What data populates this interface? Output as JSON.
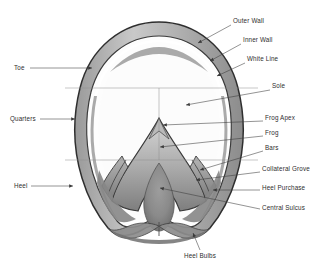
{
  "figure": {
    "style": "pencil sketch line drawing with labelled leader lines",
    "background_color": "#ffffff",
    "ink_color": "#2e2e2e",
    "leader_color": "#3a3a3a",
    "reference_line_color": "#8e8e8e"
  },
  "labels": {
    "left": [
      {
        "id": "toe",
        "text": "Toe",
        "text_x": 14,
        "text_y": 70,
        "line_x1": 30,
        "line_y1": 68,
        "line_x2": 92,
        "line_y2": 68
      },
      {
        "id": "quarters",
        "text": "Quarters",
        "text_x": 10,
        "text_y": 121,
        "line_x1": 40,
        "line_y1": 119,
        "line_x2": 75,
        "line_y2": 119
      },
      {
        "id": "heel",
        "text": "Heel",
        "text_x": 14,
        "text_y": 188,
        "line_x1": 31,
        "line_y1": 186,
        "line_x2": 73,
        "line_y2": 186
      }
    ],
    "right": [
      {
        "id": "outer-wall",
        "text": "Outer Wall",
        "text_x": 233,
        "text_y": 23,
        "line_x1": 231,
        "line_y1": 25,
        "line_x2": 198,
        "line_y2": 43
      },
      {
        "id": "inner-wall",
        "text": "Inner Wall",
        "text_x": 243,
        "text_y": 42,
        "line_x1": 241,
        "line_y1": 44,
        "line_x2": 210,
        "line_y2": 61
      },
      {
        "id": "white-line",
        "text": "White Line",
        "text_x": 247,
        "text_y": 61,
        "line_x1": 245,
        "line_y1": 63,
        "line_x2": 217,
        "line_y2": 76
      },
      {
        "id": "sole",
        "text": "Sole",
        "text_x": 272,
        "text_y": 88,
        "line_x1": 270,
        "line_y1": 90,
        "line_x2": 186,
        "line_y2": 105
      },
      {
        "id": "frog-apex",
        "text": "Frog Apex",
        "text_x": 265,
        "text_y": 120,
        "line_x1": 263,
        "line_y1": 121,
        "line_x2": 163,
        "line_y2": 125
      },
      {
        "id": "frog",
        "text": "Frog",
        "text_x": 265,
        "text_y": 135,
        "line_x1": 263,
        "line_y1": 136,
        "line_x2": 160,
        "line_y2": 147
      },
      {
        "id": "bars",
        "text": "Bars",
        "text_x": 265,
        "text_y": 150,
        "line_x1": 263,
        "line_y1": 151,
        "line_x2": 200,
        "line_y2": 170
      },
      {
        "id": "collateral-grove",
        "text": "Collateral Grove",
        "text_x": 262,
        "text_y": 171,
        "line_x1": 260,
        "line_y1": 172,
        "line_x2": 196,
        "line_y2": 180
      },
      {
        "id": "heel-purchase",
        "text": "Heel Purchase",
        "text_x": 262,
        "text_y": 190,
        "line_x1": 260,
        "line_y1": 190,
        "line_x2": 213,
        "line_y2": 190
      },
      {
        "id": "central-sulcus",
        "text": "Central Sulcus",
        "text_x": 262,
        "text_y": 210,
        "line_x1": 260,
        "line_y1": 209,
        "line_x2": 160,
        "line_y2": 188
      }
    ],
    "bottom": [
      {
        "id": "heel-bulbs",
        "text": "Heel Bulbs",
        "text_x": 200,
        "text_y": 258,
        "line_x1": 200,
        "line_y1": 250,
        "line_x2": 193,
        "line_y2": 233
      }
    ]
  },
  "reference_lines": {
    "horizontal": [
      {
        "id": "upper-guide",
        "x1": 65,
        "y1": 88,
        "x2": 258,
        "y2": 88
      },
      {
        "id": "lower-guide",
        "x1": 65,
        "y1": 160,
        "x2": 258,
        "y2": 160
      }
    ],
    "vertical": [
      {
        "id": "center-axis",
        "x1": 159,
        "y1": 88,
        "x2": 159,
        "y2": 160
      }
    ]
  },
  "anatomy_parts": [
    "Toe",
    "Quarters",
    "Heel",
    "Outer Wall",
    "Inner Wall",
    "White Line",
    "Sole",
    "Frog Apex",
    "Frog",
    "Bars",
    "Collateral Grove",
    "Heel Purchase",
    "Central Sulcus",
    "Heel Bulbs"
  ]
}
